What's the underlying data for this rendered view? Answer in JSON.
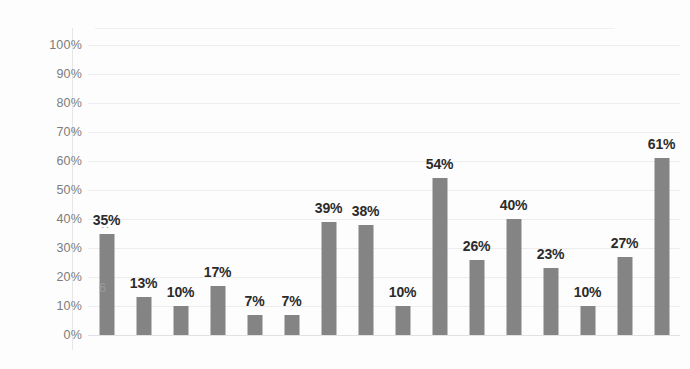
{
  "chart_data": {
    "type": "bar",
    "title": "",
    "subtitle": "",
    "xlabel": "",
    "ylabel": "",
    "ylim": [
      0,
      100
    ],
    "y_unit": "%",
    "grid": true,
    "legend": null,
    "categories": [
      "1",
      "2",
      "3",
      "4",
      "5",
      "6",
      "7",
      "8",
      "9",
      "10",
      "11",
      "12",
      "13",
      "14",
      "15",
      "16"
    ],
    "values": [
      35,
      13,
      10,
      17,
      7,
      7,
      39,
      38,
      10,
      54,
      26,
      40,
      23,
      10,
      27,
      61
    ],
    "data_labels": [
      "35%",
      "13%",
      "10%",
      "17%",
      "7%",
      "7%",
      "39%",
      "38%",
      "10%",
      "54%",
      "26%",
      "40%",
      "23%",
      "10%",
      "27%",
      "61%"
    ],
    "y_ticks": [
      0,
      10,
      20,
      30,
      40,
      50,
      60,
      70,
      80,
      90,
      100
    ],
    "y_tick_labels": [
      "0%",
      "10%",
      "20%",
      "30%",
      "40%",
      "50%",
      "60%",
      "70%",
      "80%",
      "90%",
      "100%"
    ],
    "x_tick_labels": [],
    "colors": {
      "bar": "#848484",
      "gridline": "#ededed",
      "axis_text": "#7c7c7c",
      "data_label": "#2b2b2b",
      "background": "#fdfdfd"
    }
  },
  "artifacts": {
    "dots_mark": ":",
    "six_mark": "6"
  }
}
